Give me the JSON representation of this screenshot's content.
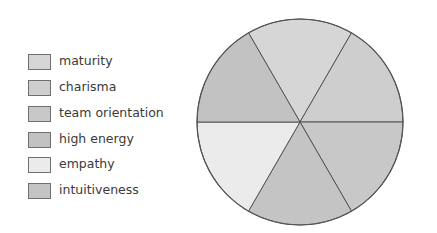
{
  "chart_data": {
    "type": "pie",
    "title": "",
    "categories": [
      "maturity",
      "charisma",
      "team orientation",
      "high energy",
      "empathy",
      "intuitiveness"
    ],
    "values": [
      16.67,
      16.67,
      16.67,
      16.67,
      16.67,
      16.67
    ],
    "colors": [
      "#d6d6d6",
      "#cecece",
      "#c8c8c8",
      "#c2c2c2",
      "#ebebeb",
      "#c4c4c4"
    ],
    "legend_position": "left",
    "slice_outline_color": "#555555"
  },
  "legend": {
    "items": [
      {
        "label": "maturity",
        "color": "#d6d6d6"
      },
      {
        "label": "charisma",
        "color": "#cecece"
      },
      {
        "label": "team orientation",
        "color": "#c8c8c8"
      },
      {
        "label": "high energy",
        "color": "#c2c2c2"
      },
      {
        "label": "empathy",
        "color": "#ebebeb"
      },
      {
        "label": "intuitiveness",
        "color": "#c4c4c4"
      }
    ]
  }
}
